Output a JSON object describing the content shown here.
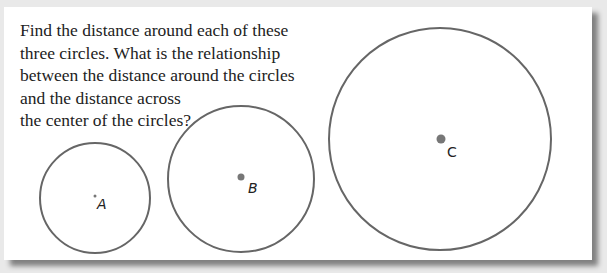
{
  "prompt": {
    "lines": [
      "Find the distance around each of these",
      "three circles. What is the relationship",
      "between the distance around the circles",
      "and the distance across",
      "the center of the circles?"
    ]
  },
  "circles": [
    {
      "label": "A",
      "cx": 95,
      "cy": 198,
      "r": 55,
      "dot_r": 1.5
    },
    {
      "label": "B",
      "cx": 241,
      "cy": 179,
      "r": 73,
      "dot_r": 3.5
    },
    {
      "label": "C",
      "cx": 440,
      "cy": 139,
      "r": 111,
      "dot_r": 4.5
    }
  ],
  "colors": {
    "circle_stroke": "#666666",
    "dot": "#777777",
    "background": "#e9e9e9",
    "card": "#ffffff"
  }
}
